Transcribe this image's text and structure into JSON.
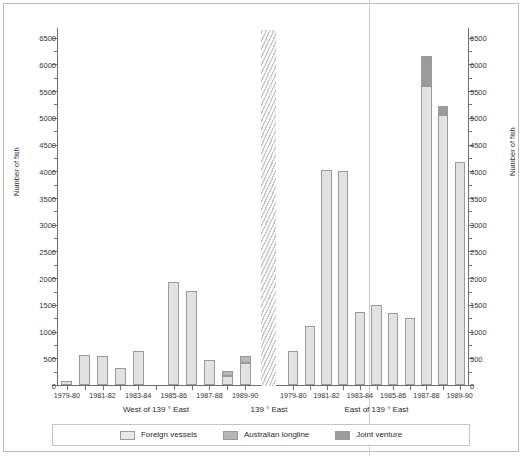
{
  "chart_data": {
    "type": "bar",
    "title": "",
    "subtitle": "",
    "xlabel": "",
    "ylabel": "Number of fish",
    "ylabel_right": "Number of fish",
    "ylim": [
      0,
      6700
    ],
    "ytick_step": 500,
    "yticks": [
      0,
      500,
      1000,
      1500,
      2000,
      2500,
      3000,
      3500,
      4000,
      4500,
      5000,
      5500,
      6000,
      6500
    ],
    "ytick_labels": [
      "0",
      "500",
      "1000",
      "1500",
      "2000",
      "2500",
      "3000",
      "3500",
      "4000",
      "4500",
      "5000",
      "5500",
      "6000",
      "6500"
    ],
    "grid": false,
    "stacked": true,
    "legend_position": "bottom",
    "legend": [
      "Foreign vessels",
      "Australian longline",
      "Joint venture"
    ],
    "series_colors": {
      "foreign_vessels": "#e2e2e2",
      "australian_longline": "#b6b6b6",
      "joint_venture": "#9b9b9b"
    },
    "panels": [
      {
        "name": "west",
        "caption": "West of 139 ° East",
        "categories": [
          "1979-80",
          "1980-81",
          "1981-82",
          "1982-83",
          "1983-84",
          "1984-85",
          "1985-86",
          "1986-87",
          "1987-88",
          "1988-89",
          "1989-90"
        ],
        "tick_labels": [
          "1979-80",
          "",
          "1981-82",
          "",
          "1983-84",
          "",
          "1985-86",
          "",
          "1987-88",
          "",
          "1989-90"
        ],
        "series": [
          {
            "name": "Foreign vessels",
            "values": [
              80,
              560,
              545,
              325,
              645,
              0,
              1920,
              1760,
              470,
              170,
              420
            ]
          },
          {
            "name": "Australian longline",
            "values": [
              0,
              0,
              0,
              0,
              0,
              0,
              0,
              0,
              0,
              100,
              120
            ]
          },
          {
            "name": "Joint venture",
            "values": [
              0,
              0,
              0,
              0,
              0,
              0,
              0,
              0,
              0,
              0,
              0
            ]
          }
        ],
        "totals": [
          80,
          560,
          545,
          325,
          645,
          0,
          1920,
          1760,
          470,
          270,
          540
        ]
      },
      {
        "name": "east",
        "caption": "East of 139 ° East",
        "categories": [
          "1979-80",
          "1980-81",
          "1981-82",
          "1982-83",
          "1983-84",
          "1984-85",
          "1985-86",
          "1986-87",
          "1987-88",
          "1988-89",
          "1989-90"
        ],
        "tick_labels": [
          "1979-80",
          "",
          "1981-82",
          "",
          "1983-84",
          "",
          "1985-86",
          "",
          "1987-88",
          "",
          "1989-90"
        ],
        "series": [
          {
            "name": "Foreign vessels",
            "values": [
              630,
              1100,
              4030,
              4010,
              1370,
              1500,
              1340,
              1260,
              5600,
              5050,
              4180
            ]
          },
          {
            "name": "Australian longline",
            "values": [
              0,
              0,
              0,
              0,
              0,
              0,
              0,
              0,
              0,
              0,
              0
            ]
          },
          {
            "name": "Joint venture",
            "values": [
              0,
              0,
              0,
              0,
              0,
              0,
              0,
              0,
              550,
              170,
              0
            ]
          }
        ],
        "totals": [
          630,
          1100,
          4030,
          4010,
          1370,
          1500,
          1340,
          1260,
          6150,
          5220,
          4180
        ]
      }
    ],
    "separator_label": "139 ° East",
    "annotations": []
  }
}
